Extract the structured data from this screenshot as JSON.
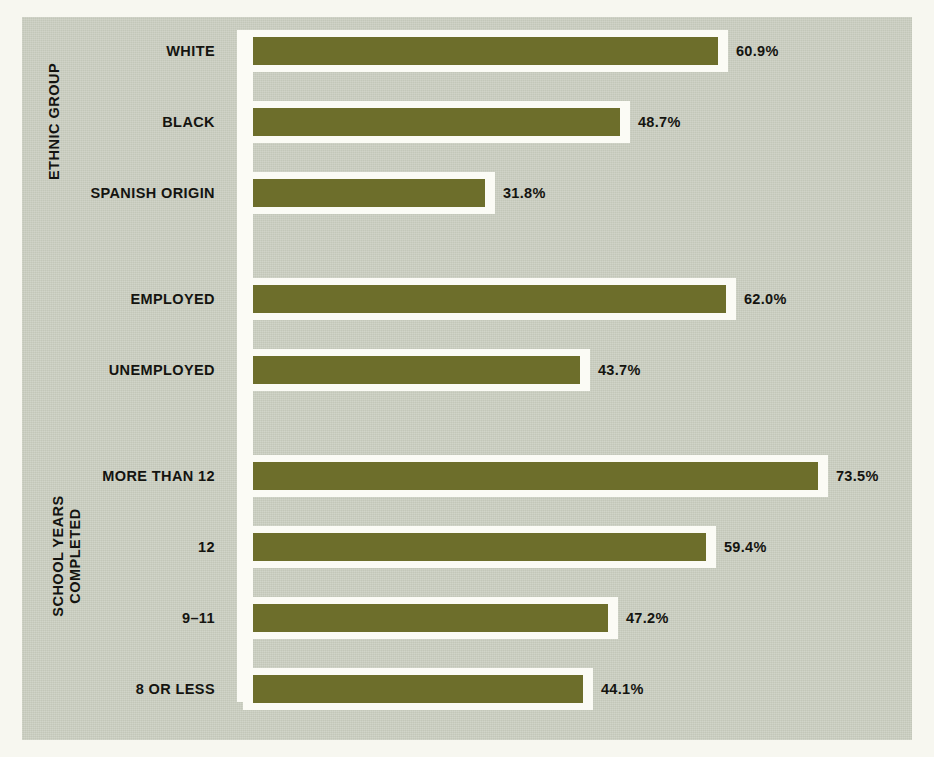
{
  "chart_data": {
    "type": "bar",
    "orientation": "horizontal",
    "title": "",
    "subtitle": "",
    "xlabel": "",
    "ylabel": "",
    "xlim": [
      0,
      80
    ],
    "grid": false,
    "legend": null,
    "value_suffix": "%",
    "groups": [
      {
        "caption": "ETHNIC GROUP",
        "categories": [
          "WHITE",
          "BLACK",
          "SPANISH ORIGIN"
        ],
        "values": [
          60.9,
          48.7,
          31.8
        ],
        "labels": [
          "60.9%",
          "48.7%",
          "31.8%"
        ]
      },
      {
        "caption": "",
        "categories": [
          "EMPLOYED",
          "UNEMPLOYED"
        ],
        "values": [
          62.0,
          43.7
        ],
        "labels": [
          "62.0%",
          "43.7%"
        ]
      },
      {
        "caption": "SCHOOL YEARS\nCOMPLETED",
        "categories": [
          "MORE THAN 12",
          "12",
          "9–11",
          "8 OR LESS"
        ],
        "values": [
          73.5,
          59.4,
          47.2,
          44.1
        ],
        "labels": [
          "73.5%",
          "59.4%",
          "47.2%",
          "44.1%"
        ]
      }
    ],
    "categories": [
      "WHITE",
      "BLACK",
      "SPANISH ORIGIN",
      "EMPLOYED",
      "UNEMPLOYED",
      "MORE THAN 12",
      "12",
      "9–11",
      "8 OR LESS"
    ],
    "values": [
      60.9,
      48.7,
      31.8,
      62.0,
      43.7,
      73.5,
      59.4,
      47.2,
      44.1
    ],
    "colors": {
      "bar": "#6d6e2b",
      "bar_outline": "#fbfbf5",
      "plot_background": "#c9cdbf",
      "page_background": "#f7f7f0",
      "text": "#141410",
      "axis_band": "#fbfbf5"
    }
  },
  "rows": [
    {
      "label": "WHITE",
      "value": 60.9,
      "value_label": "60.9%"
    },
    {
      "label": "BLACK",
      "value": 48.7,
      "value_label": "48.7%"
    },
    {
      "label": "SPANISH ORIGIN",
      "value": 31.8,
      "value_label": "31.8%"
    },
    {
      "label": "EMPLOYED",
      "value": 62.0,
      "value_label": "62.0%"
    },
    {
      "label": "UNEMPLOYED",
      "value": 43.7,
      "value_label": "43.7%"
    },
    {
      "label": "MORE THAN 12",
      "value": 73.5,
      "value_label": "73.5%"
    },
    {
      "label": "12",
      "value": 59.4,
      "value_label": "59.4%"
    },
    {
      "label": "9–11",
      "value": 47.2,
      "value_label": "47.2%"
    },
    {
      "label": "8 OR LESS",
      "value": 44.1,
      "value_label": "44.1%"
    }
  ],
  "captions": {
    "ethnic_group": "ETHNIC GROUP",
    "school_years_line1": "SCHOOL YEARS",
    "school_years_line2": "COMPLETED"
  }
}
